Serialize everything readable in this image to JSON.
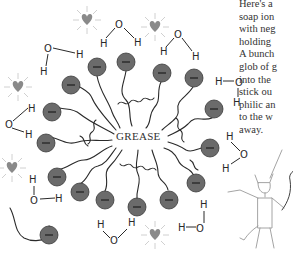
{
  "diagram": {
    "center_label": "GREASE",
    "caption_lines": [
      "Here's a",
      "soap ion",
      "with neg",
      "holding",
      "A bunch",
      "glob of g",
      "into the",
      "stick ou",
      "philic an",
      "to the w",
      "away."
    ],
    "ion_charge_symbol": "−",
    "water_atoms": {
      "oxygen": "O",
      "hydrogen": "H"
    },
    "colors": {
      "ion_fill": "#6b6b6b",
      "ion_stroke": "#3a3a3a",
      "tail": "#2a2a2a",
      "heart": "#8a8a8a",
      "sparkle": "#c4c4c4",
      "devil": "#9a9a9a",
      "text": "#333333"
    },
    "elements": {
      "soap_ions": 18,
      "water_molecules": 11,
      "hearts": 5,
      "devil": 1
    }
  }
}
